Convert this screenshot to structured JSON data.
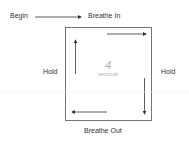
{
  "diagram": {
    "start_label": "Begin",
    "steps": [
      {
        "label": "Breathe In",
        "position": "top"
      },
      {
        "label": "Hold",
        "position": "right"
      },
      {
        "label": "Breathe Out",
        "position": "bottom"
      },
      {
        "label": "Hold",
        "position": "left"
      }
    ],
    "center": {
      "value": "4",
      "unit": "seconds"
    },
    "colors": {
      "line": "#555555",
      "text": "#333333",
      "center_text": "#b0b0b0"
    }
  }
}
